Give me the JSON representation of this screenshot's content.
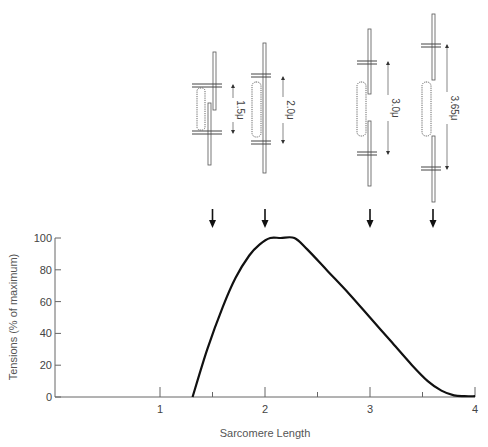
{
  "chart_data": {
    "type": "line",
    "title": "",
    "xlabel": "Sarcomere Length",
    "ylabel": "Tensions (% of maximum)",
    "xlim": [
      0,
      4
    ],
    "ylim": [
      0,
      100
    ],
    "x_ticks": [
      {
        "value": 1,
        "label": "1"
      },
      {
        "value": 2,
        "label": "2"
      },
      {
        "value": 3,
        "label": "3"
      },
      {
        "value": 4,
        "label": "4"
      }
    ],
    "x_minor_ticks": [
      1.5,
      2.5,
      3.5
    ],
    "y_ticks": [
      {
        "value": 0,
        "label": "0"
      },
      {
        "value": 20,
        "label": "20"
      },
      {
        "value": 40,
        "label": "40"
      },
      {
        "value": 60,
        "label": "60"
      },
      {
        "value": 80,
        "label": "80"
      },
      {
        "value": 100,
        "label": "100"
      }
    ],
    "grid": false,
    "series": [
      {
        "name": "Length-tension curve",
        "color": "#111111",
        "x": [
          1.31,
          1.45,
          1.6,
          1.72,
          1.85,
          1.95,
          2.05,
          2.15,
          2.28,
          2.4,
          2.6,
          2.8,
          3.0,
          3.2,
          3.4,
          3.55,
          3.68,
          3.8,
          3.9,
          4.0
        ],
        "y": [
          0,
          30,
          57,
          75,
          89,
          96,
          100,
          100,
          100,
          93,
          79,
          65,
          50,
          35,
          20,
          10,
          4,
          1,
          0.5,
          0.5
        ]
      }
    ],
    "annotations": {
      "arrows": [
        {
          "x": 1.5,
          "label": "1.5μ"
        },
        {
          "x": 2.0,
          "label": "2.0μ"
        },
        {
          "x": 3.0,
          "label": "3.0μ"
        },
        {
          "x": 3.6,
          "label": "3.65μ"
        }
      ]
    }
  }
}
